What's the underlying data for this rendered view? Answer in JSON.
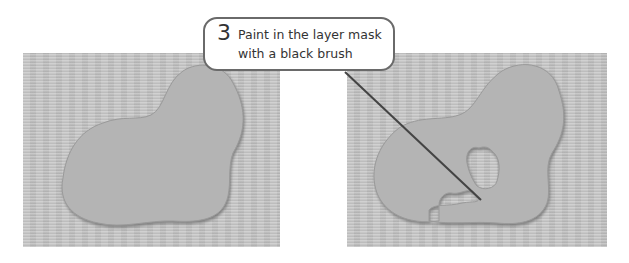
{
  "callout": {
    "step_number": "3",
    "text": "Paint in the layer mask with a black brush"
  },
  "panels": [
    {
      "name": "before",
      "description": "textured background with smooth blob-shaped layer"
    },
    {
      "name": "after",
      "description": "blob-shaped layer with masked-out notch painted with black brush"
    }
  ],
  "colors": {
    "background": "#ffffff",
    "canvas_texture": "#c4c4c4",
    "blob_fill": "#b2b2b2",
    "blob_shadow": "#8a8a8a",
    "callout_border": "#6a6a6a",
    "leader_line": "#444444"
  }
}
